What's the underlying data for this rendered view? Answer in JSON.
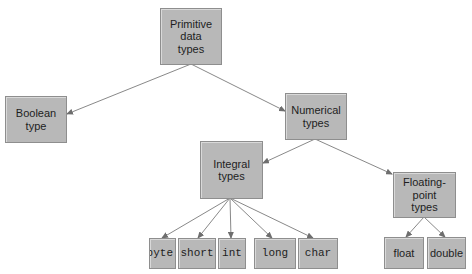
{
  "diagram": {
    "type": "tree",
    "root": "primitive",
    "nodes": {
      "primitive": {
        "label": "Primitive\ndata\ntypes"
      },
      "boolean": {
        "label": "Boolean\ntype"
      },
      "numerical": {
        "label": "Numerical\ntypes"
      },
      "integral": {
        "label": "Integral\ntypes"
      },
      "floating": {
        "label": "Floating-\npoint\ntypes"
      },
      "byte": {
        "label": "byte"
      },
      "short": {
        "label": "short"
      },
      "int": {
        "label": "int"
      },
      "long": {
        "label": "long"
      },
      "char": {
        "label": "char"
      },
      "float": {
        "label": "float"
      },
      "double": {
        "label": "double"
      }
    },
    "edges": [
      {
        "from": "primitive",
        "to": "boolean"
      },
      {
        "from": "primitive",
        "to": "numerical"
      },
      {
        "from": "numerical",
        "to": "integral"
      },
      {
        "from": "numerical",
        "to": "floating"
      },
      {
        "from": "integral",
        "to": "byte"
      },
      {
        "from": "integral",
        "to": "short"
      },
      {
        "from": "integral",
        "to": "int"
      },
      {
        "from": "integral",
        "to": "long"
      },
      {
        "from": "integral",
        "to": "char"
      },
      {
        "from": "floating",
        "to": "float"
      },
      {
        "from": "floating",
        "to": "double"
      }
    ],
    "colors": {
      "node_fill": "#b8b8b8",
      "node_border": "#8e8e8e",
      "edge": "#6e6e6e",
      "text": "#1e1e1e"
    }
  }
}
